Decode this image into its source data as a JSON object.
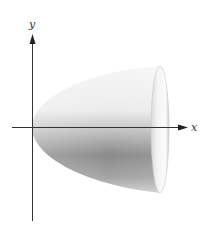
{
  "figure": {
    "axes": {
      "x_label": "x",
      "y_label": "y"
    },
    "colors": {
      "axis": "#333333",
      "surface_light": "#f4f4f4",
      "surface_mid": "#c8c8c8",
      "surface_dark": "#7a7a7a",
      "cap_light": "#fafafa",
      "cap_shade": "#bdbdbd",
      "background": "#ffffff"
    }
  }
}
